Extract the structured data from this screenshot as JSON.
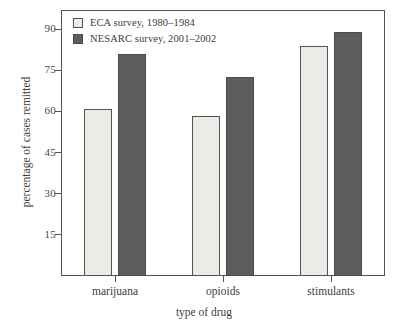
{
  "chart_data": {
    "type": "bar",
    "title": "",
    "xlabel": "type of drug",
    "ylabel": "percentage of cases remitted",
    "categories": [
      "marijuana",
      "opioids",
      "stimulants"
    ],
    "series": [
      {
        "name": "ECA survey, 1980–1984",
        "color": "#ecebe7",
        "values": [
          61,
          58.5,
          84
        ]
      },
      {
        "name": "NESARC survey, 2001–2002",
        "color": "#5f5d5b",
        "values": [
          81,
          72.5,
          89
        ]
      }
    ],
    "yticks": [
      15,
      30,
      45,
      60,
      75,
      90
    ],
    "ytick_labels": [
      "15",
      "30",
      "45",
      "60",
      "75",
      "90"
    ],
    "ylim": [
      0,
      97
    ],
    "grid": false,
    "legend_position": "upper-left-inside",
    "frame": true
  },
  "legend": {
    "entries": [
      {
        "label": "ECA survey, 1980–1984",
        "swatch": "light"
      },
      {
        "label": "NESARC survey, 2001–2002",
        "swatch": "dark"
      }
    ]
  }
}
